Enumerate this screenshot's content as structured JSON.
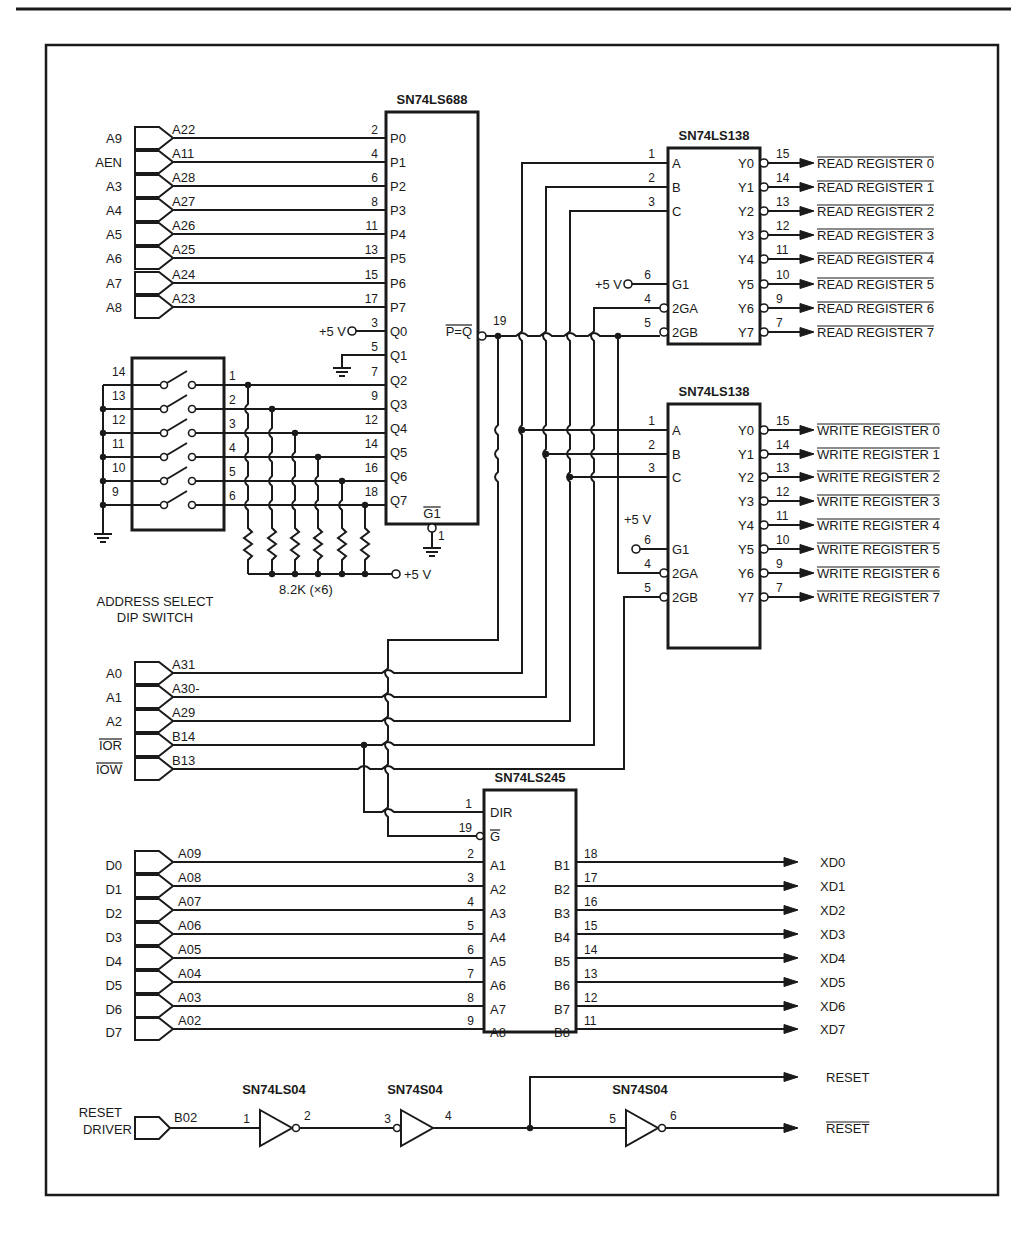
{
  "diagram": {
    "chips": {
      "comparator": {
        "name": "SN74LS688",
        "output_label": "P=Q",
        "output_pin": "19",
        "enable_label": "G1",
        "enable_pin": "1",
        "p_pins": [
          {
            "pin": "2",
            "label": "P0"
          },
          {
            "pin": "4",
            "label": "P1"
          },
          {
            "pin": "6",
            "label": "P2"
          },
          {
            "pin": "8",
            "label": "P3"
          },
          {
            "pin": "11",
            "label": "P4"
          },
          {
            "pin": "13",
            "label": "P5"
          },
          {
            "pin": "15",
            "label": "P6"
          },
          {
            "pin": "17",
            "label": "P7"
          }
        ],
        "q_pins": [
          {
            "pin": "3",
            "label": "Q0"
          },
          {
            "pin": "5",
            "label": "Q1"
          },
          {
            "pin": "7",
            "label": "Q2"
          },
          {
            "pin": "9",
            "label": "Q3"
          },
          {
            "pin": "12",
            "label": "Q4"
          },
          {
            "pin": "14",
            "label": "Q5"
          },
          {
            "pin": "16",
            "label": "Q6"
          },
          {
            "pin": "18",
            "label": "Q7"
          }
        ]
      },
      "read_decoder": {
        "name": "SN74LS138",
        "inputs": [
          {
            "pin": "1",
            "label": "A"
          },
          {
            "pin": "2",
            "label": "B"
          },
          {
            "pin": "3",
            "label": "C"
          }
        ],
        "enables": [
          {
            "pin": "6",
            "label": "G1"
          },
          {
            "pin": "4",
            "label": "2GA"
          },
          {
            "pin": "5",
            "label": "2GB"
          }
        ],
        "outputs": [
          {
            "pin": "15",
            "label": "Y0"
          },
          {
            "pin": "14",
            "label": "Y1"
          },
          {
            "pin": "13",
            "label": "Y2"
          },
          {
            "pin": "12",
            "label": "Y3"
          },
          {
            "pin": "11",
            "label": "Y4"
          },
          {
            "pin": "10",
            "label": "Y5"
          },
          {
            "pin": "9",
            "label": "Y6"
          },
          {
            "pin": "7",
            "label": "Y7"
          }
        ]
      },
      "write_decoder": {
        "name": "SN74LS138",
        "inputs": [
          {
            "pin": "1",
            "label": "A"
          },
          {
            "pin": "2",
            "label": "B"
          },
          {
            "pin": "3",
            "label": "C"
          }
        ],
        "enables": [
          {
            "pin": "6",
            "label": "G1"
          },
          {
            "pin": "4",
            "label": "2GA"
          },
          {
            "pin": "5",
            "label": "2GB"
          }
        ],
        "outputs": [
          {
            "pin": "15",
            "label": "Y0"
          },
          {
            "pin": "14",
            "label": "Y1"
          },
          {
            "pin": "13",
            "label": "Y2"
          },
          {
            "pin": "12",
            "label": "Y3"
          },
          {
            "pin": "11",
            "label": "Y4"
          },
          {
            "pin": "10",
            "label": "Y5"
          },
          {
            "pin": "9",
            "label": "Y6"
          },
          {
            "pin": "7",
            "label": "Y7"
          }
        ]
      },
      "transceiver": {
        "name": "SN74LS245",
        "dir_label": "DIR",
        "dir_pin": "1",
        "g_label": "G",
        "g_pin": "19",
        "a_pins": [
          {
            "pin": "2",
            "label": "A1"
          },
          {
            "pin": "3",
            "label": "A2"
          },
          {
            "pin": "4",
            "label": "A3"
          },
          {
            "pin": "5",
            "label": "A4"
          },
          {
            "pin": "6",
            "label": "A5"
          },
          {
            "pin": "7",
            "label": "A6"
          },
          {
            "pin": "8",
            "label": "A7"
          },
          {
            "pin": "9",
            "label": "A8"
          }
        ],
        "b_pins": [
          {
            "pin": "18",
            "label": "B1"
          },
          {
            "pin": "17",
            "label": "B2"
          },
          {
            "pin": "16",
            "label": "B3"
          },
          {
            "pin": "15",
            "label": "B4"
          },
          {
            "pin": "14",
            "label": "B5"
          },
          {
            "pin": "13",
            "label": "B6"
          },
          {
            "pin": "12",
            "label": "B7"
          },
          {
            "pin": "11",
            "label": "B8"
          }
        ]
      },
      "inverters": [
        {
          "name": "SN74LS04",
          "in_pin": "1",
          "out_pin": "2"
        },
        {
          "name": "SN74S04",
          "in_pin": "3",
          "out_pin": "4"
        },
        {
          "name": "SN74S04",
          "in_pin": "5",
          "out_pin": "6"
        }
      ]
    },
    "address_inputs": [
      {
        "signal": "A9",
        "bus": "A22"
      },
      {
        "signal": "AEN",
        "bus": "A11"
      },
      {
        "signal": "A3",
        "bus": "A28"
      },
      {
        "signal": "A4",
        "bus": "A27"
      },
      {
        "signal": "A5",
        "bus": "A26"
      },
      {
        "signal": "A6",
        "bus": "A25"
      },
      {
        "signal": "A7",
        "bus": "A24"
      },
      {
        "signal": "A8",
        "bus": "A23"
      }
    ],
    "dip_switch": {
      "label_line1": "ADDRESS SELECT",
      "label_line2": "DIP SWITCH",
      "left_pins": [
        "14",
        "13",
        "12",
        "11",
        "10",
        "9"
      ],
      "right_pins": [
        "1",
        "2",
        "3",
        "4",
        "5",
        "6"
      ]
    },
    "resistors": {
      "label": "8.2K (×6)"
    },
    "supply": {
      "label": "+5 V"
    },
    "control_inputs": [
      {
        "signal": "A0",
        "bus": "A31"
      },
      {
        "signal": "A1",
        "bus": "A30-"
      },
      {
        "signal": "A2",
        "bus": "A29"
      },
      {
        "signal": "IOR",
        "bus": "B14",
        "overbar": true
      },
      {
        "signal": "IOW",
        "bus": "B13",
        "overbar": true
      }
    ],
    "data_inputs": [
      {
        "signal": "D0",
        "bus": "A09"
      },
      {
        "signal": "D1",
        "bus": "A08"
      },
      {
        "signal": "D2",
        "bus": "A07"
      },
      {
        "signal": "D3",
        "bus": "A06"
      },
      {
        "signal": "D4",
        "bus": "A05"
      },
      {
        "signal": "D5",
        "bus": "A04"
      },
      {
        "signal": "D6",
        "bus": "A03"
      },
      {
        "signal": "D7",
        "bus": "A02"
      }
    ],
    "read_outputs": [
      "READ REGISTER 0",
      "READ REGISTER 1",
      "READ REGISTER 2",
      "READ REGISTER 3",
      "READ REGISTER 4",
      "READ REGISTER 5",
      "READ REGISTER 6",
      "READ REGISTER 7"
    ],
    "write_outputs": [
      "WRITE REGISTER 0",
      "WRITE REGISTER 1",
      "WRITE REGISTER 2",
      "WRITE REGISTER 3",
      "WRITE REGISTER 4",
      "WRITE REGISTER 5",
      "WRITE REGISTER 6",
      "WRITE REGISTER 7"
    ],
    "data_outputs": [
      "XD0",
      "XD1",
      "XD2",
      "XD3",
      "XD4",
      "XD5",
      "XD6",
      "XD7"
    ],
    "reset": {
      "input_line1": "RESET",
      "input_line2": "DRIVER",
      "bus": "B02",
      "out_true": "RESET",
      "out_inverted": "RESET"
    }
  }
}
